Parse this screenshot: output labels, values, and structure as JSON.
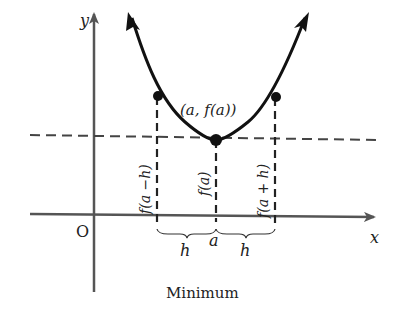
{
  "figure": {
    "caption": "Minimum",
    "axes": {
      "x_label": "x",
      "y_label": "y",
      "origin_label": "O"
    },
    "curve": {
      "type": "parabola-upward",
      "description": "Function f with a local minimum at x = a"
    },
    "points": {
      "minimum_label": "(a, f(a))",
      "left_point": "(a - h, f(a - h))",
      "right_point": "(a + h, f(a + h))"
    },
    "vertical_labels": {
      "left": "f(a −h)",
      "center": "f(a)",
      "right": "f(a + h)"
    },
    "x_axis_labels": {
      "left_interval": "h",
      "center": "a",
      "right_interval": "h"
    },
    "colors": {
      "curve": "#111111",
      "axes": "#555555",
      "dashes": "#444444"
    }
  }
}
